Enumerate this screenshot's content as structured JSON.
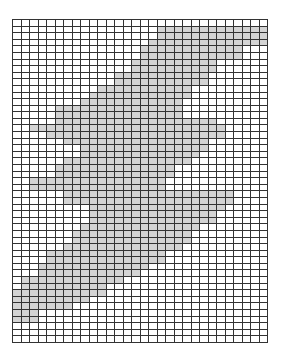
{
  "grid": {
    "columns": 30,
    "rows": 49,
    "line_color": "#333333",
    "fill_color": "#ffffff",
    "shade_color": "#d4d4d4",
    "shaded_spans": [
      [],
      [
        [
          17,
          30
        ]
      ],
      [
        [
          17,
          30
        ]
      ],
      [
        [
          16,
          30
        ]
      ],
      [
        [
          15,
          27
        ]
      ],
      [
        [
          15,
          27
        ]
      ],
      [
        [
          14,
          24
        ]
      ],
      [
        [
          14,
          24
        ]
      ],
      [
        [
          12,
          23
        ]
      ],
      [
        [
          12,
          23
        ]
      ],
      [
        [
          10,
          21
        ]
      ],
      [
        [
          9,
          21
        ]
      ],
      [
        [
          8,
          20
        ]
      ],
      [
        [
          5,
          20
        ]
      ],
      [
        [
          5,
          20
        ]
      ],
      [
        [
          5,
          24
        ]
      ],
      [
        [
          2,
          25
        ]
      ],
      [
        [
          4,
          25
        ]
      ],
      [
        [
          6,
          23
        ]
      ],
      [
        [
          8,
          23
        ]
      ],
      [
        [
          8,
          22
        ]
      ],
      [
        [
          6,
          21
        ]
      ],
      [
        [
          5,
          19
        ]
      ],
      [
        [
          5,
          19
        ]
      ],
      [
        [
          2,
          18
        ]
      ],
      [
        [
          2,
          18
        ]
      ],
      [
        [
          6,
          26
        ]
      ],
      [
        [
          6,
          26
        ]
      ],
      [
        [
          9,
          25
        ]
      ],
      [
        [
          9,
          24
        ]
      ],
      [
        [
          9,
          24
        ]
      ],
      [
        [
          8,
          22
        ]
      ],
      [
        [
          7,
          21
        ]
      ],
      [
        [
          7,
          21
        ]
      ],
      [
        [
          6,
          20
        ]
      ],
      [
        [
          4,
          18
        ]
      ],
      [
        [
          4,
          18
        ]
      ],
      [
        [
          3,
          16
        ]
      ],
      [
        [
          3,
          15
        ]
      ],
      [
        [
          1,
          13
        ]
      ],
      [
        [
          1,
          11
        ]
      ],
      [
        [
          0,
          11
        ]
      ],
      [
        [
          0,
          9
        ]
      ],
      [
        [
          0,
          7
        ]
      ],
      [
        [
          0,
          3
        ]
      ],
      [
        [
          0,
          3
        ]
      ],
      [],
      [],
      []
    ]
  }
}
